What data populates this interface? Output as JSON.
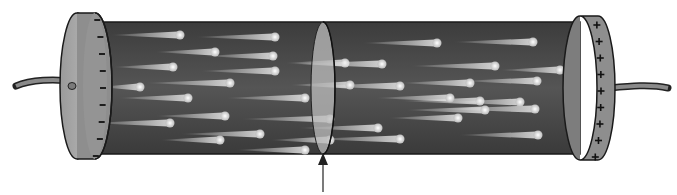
{
  "diagram": {
    "title": "",
    "colors": {
      "background": "#ffffff",
      "cylinder_body": "#4a4a4a",
      "cap_face": "#a8a8a8",
      "cap_rim": "#8c8c8c",
      "cross_section": "#b8b8b8",
      "particle": "#e6e6e6",
      "outline": "#1a1a1a"
    },
    "left_cap": {
      "sign": "−",
      "count": 9
    },
    "right_cap": {
      "sign": "+",
      "count": 9
    },
    "particles": [
      [
        180,
        35,
        70
      ],
      [
        275,
        37,
        80
      ],
      [
        215,
        52,
        60
      ],
      [
        273,
        56,
        70
      ],
      [
        173,
        67,
        60
      ],
      [
        275,
        71,
        75
      ],
      [
        140,
        87,
        40
      ],
      [
        230,
        83,
        85
      ],
      [
        188,
        98,
        70
      ],
      [
        305,
        98,
        80
      ],
      [
        170,
        123,
        80
      ],
      [
        225,
        116,
        70
      ],
      [
        260,
        134,
        80
      ],
      [
        220,
        140,
        60
      ],
      [
        330,
        119,
        90
      ],
      [
        305,
        150,
        70
      ],
      [
        437,
        43,
        75
      ],
      [
        533,
        42,
        80
      ],
      [
        345,
        63,
        60
      ],
      [
        382,
        64,
        90
      ],
      [
        495,
        66,
        85
      ],
      [
        470,
        83,
        70
      ],
      [
        537,
        81,
        75
      ],
      [
        400,
        86,
        85
      ],
      [
        480,
        101,
        80
      ],
      [
        450,
        98,
        75
      ],
      [
        535,
        109,
        95
      ],
      [
        485,
        110,
        80
      ],
      [
        520,
        102,
        70
      ],
      [
        378,
        128,
        80
      ],
      [
        458,
        118,
        70
      ],
      [
        538,
        135,
        80
      ],
      [
        400,
        139,
        90
      ],
      [
        330,
        140,
        60
      ],
      [
        350,
        85,
        60
      ],
      [
        560,
        70,
        60
      ]
    ],
    "arrow_label": ""
  }
}
